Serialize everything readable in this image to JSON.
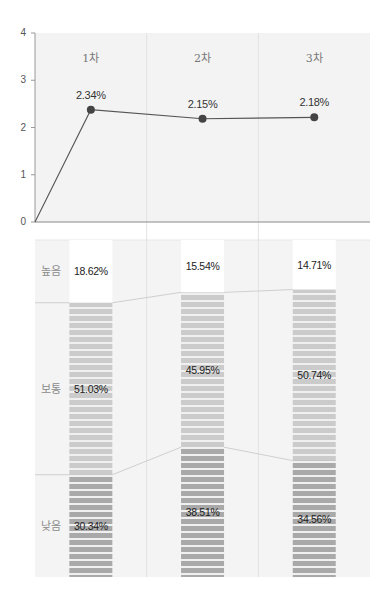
{
  "chart_data": [
    {
      "type": "line",
      "title": "",
      "xlabel": "",
      "ylabel": "",
      "categories": [
        "1차",
        "2차",
        "3차"
      ],
      "series": [
        {
          "name": "",
          "values": [
            2.34,
            2.15,
            2.18
          ],
          "labels": [
            "2.34%",
            "2.15%",
            "2.18%"
          ],
          "start_from_origin": true
        }
      ],
      "yticks": [
        "0",
        "1",
        "2",
        "3",
        "4"
      ],
      "ylim": [
        0,
        4
      ],
      "grid": "vertical column dividers",
      "point_color": "#444444",
      "line_color": "#555555"
    },
    {
      "type": "bar",
      "stacked": true,
      "normalized": true,
      "categories": [
        "1차",
        "2차",
        "3차"
      ],
      "row_labels": [
        "높음",
        "보통",
        "낮음"
      ],
      "series": [
        {
          "name": "높음",
          "values": [
            18.62,
            15.54,
            14.71
          ],
          "labels": [
            "18.62%",
            "15.54%",
            "14.71%"
          ],
          "color": "#ffffff"
        },
        {
          "name": "보통",
          "values": [
            51.03,
            45.95,
            50.74
          ],
          "labels": [
            "51.03%",
            "45.95%",
            "50.74%"
          ],
          "color": "#cbcbcb"
        },
        {
          "name": "낮음",
          "values": [
            30.34,
            38.51,
            34.56
          ],
          "labels": [
            "30.34%",
            "38.51%",
            "34.56%"
          ],
          "color": "#a9a9a9"
        }
      ],
      "ylim": [
        0,
        100
      ]
    }
  ]
}
